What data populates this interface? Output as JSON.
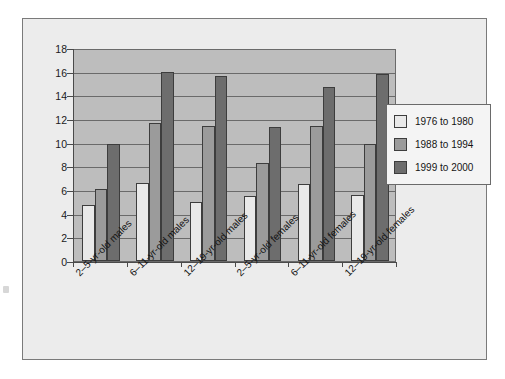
{
  "chart_data": {
    "type": "bar",
    "title": "",
    "xlabel": "",
    "ylabel": "",
    "ylim": [
      0,
      18
    ],
    "ytick_step": 2,
    "yticks": [
      0,
      2,
      4,
      6,
      8,
      10,
      12,
      14,
      16,
      18
    ],
    "grid": true,
    "legend_position": "right",
    "categories": [
      "2–5-yr-old males",
      "6–11-yr-old males",
      "12–19-yr-old males",
      "2–5-yr-old females",
      "6–11-yr-old females",
      "12–19-yr-old females"
    ],
    "series": [
      {
        "name": "1976 to 1980",
        "color": "#e9e9e9",
        "values": [
          4.7,
          6.6,
          5.0,
          5.5,
          6.5,
          5.6
        ]
      },
      {
        "name": "1988 to 1994",
        "color": "#9b9b9b",
        "values": [
          6.1,
          11.7,
          11.4,
          8.3,
          11.4,
          9.9
        ]
      },
      {
        "name": "1999 to 2000",
        "color": "#6d6d6d",
        "values": [
          9.9,
          16.0,
          15.6,
          11.3,
          14.7,
          15.8
        ]
      }
    ]
  },
  "legend": {
    "items": [
      {
        "label": "1976 to 1980"
      },
      {
        "label": "1988 to 1994"
      },
      {
        "label": "1999 to 2000"
      }
    ]
  },
  "colors": {
    "figure_background": "#ececec",
    "plot_background": "#bdbdbd",
    "axis": "#4a4a4a",
    "gridline": "#6a6a6a",
    "text": "#141414",
    "series_light": "#e9e9e9",
    "series_medium": "#9b9b9b",
    "series_dark": "#6d6d6d"
  }
}
